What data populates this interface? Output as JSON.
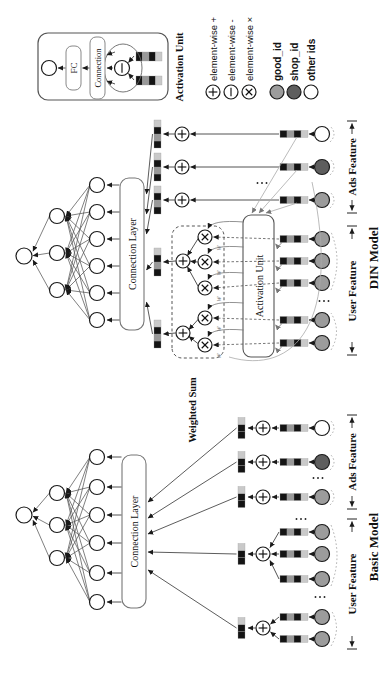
{
  "figure": {
    "legend": {
      "ops": [
        {
          "name": "element-wise-plus",
          "symbol": "plus",
          "label": "element-wise +"
        },
        {
          "name": "element-wise-minus",
          "symbol": "minus",
          "label": "element-wise -"
        },
        {
          "name": "element-wise-multiply",
          "symbol": "times",
          "label": "element-wise ×"
        }
      ],
      "ids": [
        {
          "name": "good-id",
          "label": "good_id",
          "color": "#9c9c9c"
        },
        {
          "name": "shop-id",
          "label": "shop_id",
          "color": "#5e5e5e"
        },
        {
          "name": "other-ids",
          "label": "other ids",
          "color": "#ffffff"
        }
      ]
    },
    "basic_model": {
      "model_label": "Basic Model",
      "connection_layer_label": "Connection Layer",
      "user_feature_label": "User Feature",
      "ads_feature_label": "Ads Feature"
    },
    "din_model": {
      "model_label": "DIN Model",
      "connection_layer_label": "Connection Layer",
      "activation_unit_label": "Activation Unit",
      "weighted_sum_label": "Weighted Sum",
      "weight_symbol": "w",
      "user_feature_label": "User Feature",
      "ads_feature_label": "Ads Feature"
    },
    "activation_unit_inset": {
      "title": "Activation Unit",
      "fc_label": "FC",
      "connection_label": "Connection"
    },
    "colors": {
      "embedding_cells": [
        "#141414",
        "#999999",
        "#141414",
        "#c9c9c9"
      ],
      "concat_cells_basic": [
        "#141414",
        "#141414",
        "#c9c9c9"
      ],
      "concat_cells_din": [
        "#141414",
        "#999999",
        "#141414",
        "#c9c9c9"
      ],
      "edge": "#3f3f3f",
      "gray_line": "#aaaaaa"
    }
  }
}
